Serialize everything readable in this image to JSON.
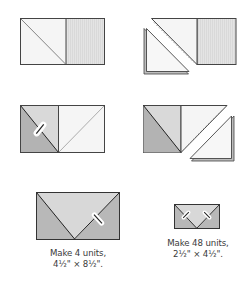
{
  "colors": {
    "outline": "#444444",
    "white_fabric": "#f6f6f6",
    "light_gray_fabric": "#e2e2e2",
    "medium_gray_fabric": "#cfcfcf",
    "dark_gray_fabric": "#b3b3b3",
    "stitch_dash": "#9a9a9a"
  },
  "steps": [
    {
      "name": "step-1-mark-diagonal",
      "description": "Square with drawn diagonal placed on striped rectangle"
    },
    {
      "name": "step-2-stitch-trim",
      "description": "Stitch on diagonal, trim excess triangle"
    },
    {
      "name": "step-3-press",
      "description": "Press corner open, add second square with diagonal"
    },
    {
      "name": "step-4-stitch-trim",
      "description": "Stitch second diagonal, trim excess triangle"
    }
  ],
  "units": [
    {
      "line1": "Make 4 units,",
      "line2": "4½\" × 8½\"."
    },
    {
      "line1": "Make 48 units,",
      "line2": "2½\" × 4½\"."
    }
  ]
}
